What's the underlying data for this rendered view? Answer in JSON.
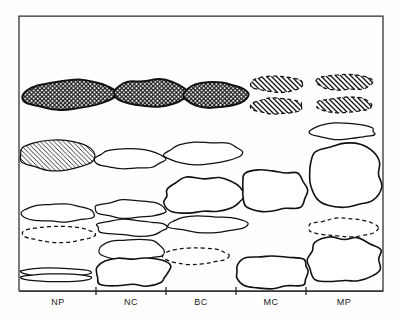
{
  "figure": {
    "name": "clast-shape-distribution-diagram",
    "background_color": "#fefefe",
    "frame_color": "#2b2b2b",
    "ink_color": "#111111"
  },
  "axis": {
    "name": "x-axis",
    "categories": [
      "NP",
      "NC",
      "BC",
      "MC",
      "MP"
    ],
    "tick_positions_px": [
      96,
      166,
      236,
      306
    ],
    "axis_y_px": 291,
    "axis_x_start_px": 19,
    "axis_x_end_px": 383,
    "label_y_px": 305
  },
  "frame": {
    "left_px": 19,
    "top_px": 16,
    "right_px": 383,
    "bottom_px": 291
  },
  "legend_patterns": {
    "crosshatch": "cross-hatched fill, solid outline",
    "diagonal_hatch_solid": "diagonal hatched fill, solid outline",
    "diagonal_hatch_dashed": "diagonal hatched fill, dashed outline",
    "plain_solid": "unfilled, solid outline",
    "plain_dashed": "unfilled, dashed outline"
  },
  "chart_data": {
    "type": "diagram",
    "title": "",
    "xlabel": "",
    "ylabel": "",
    "categories": [
      "NP",
      "NC",
      "BC",
      "MC",
      "MP"
    ],
    "column_centers_px": [
      58,
      131,
      201,
      271,
      344
    ],
    "shapes": [
      {
        "id": "s01",
        "column": "NP",
        "row": 1,
        "fill": "crosshatch",
        "outline": "solid",
        "cx": 68,
        "cy": 95,
        "rx": 47,
        "ry": 14,
        "rot": -3,
        "rough": 1.0
      },
      {
        "id": "s02",
        "column": "NC",
        "row": 1,
        "fill": "crosshatch",
        "outline": "solid",
        "cx": 151,
        "cy": 93,
        "rx": 36,
        "ry": 13,
        "rot": 0,
        "rough": 0.9
      },
      {
        "id": "s03",
        "column": "BC",
        "row": 1,
        "fill": "crosshatch",
        "outline": "solid",
        "cx": 215,
        "cy": 95,
        "rx": 32,
        "ry": 13,
        "rot": 0,
        "rough": 0.9
      },
      {
        "id": "s04",
        "column": "MC",
        "row": 1,
        "fill": "diagonal",
        "outline": "dashed",
        "cx": 277,
        "cy": 84,
        "rx": 26,
        "ry": 8,
        "rot": 0,
        "rough": 0.8
      },
      {
        "id": "s05",
        "column": "MC",
        "row": 1,
        "fill": "diagonal",
        "outline": "dashed",
        "cx": 277,
        "cy": 106,
        "rx": 26,
        "ry": 8,
        "rot": 0,
        "rough": 0.8
      },
      {
        "id": "s06",
        "column": "MP",
        "row": 1,
        "fill": "diagonal",
        "outline": "dashed",
        "cx": 344,
        "cy": 82,
        "rx": 28,
        "ry": 8,
        "rot": 0,
        "rough": 0.8
      },
      {
        "id": "s07",
        "column": "MP",
        "row": 1,
        "fill": "diagonal",
        "outline": "dashed",
        "cx": 344,
        "cy": 105,
        "rx": 28,
        "ry": 8,
        "rot": 0,
        "rough": 0.8
      },
      {
        "id": "s08",
        "column": "MP",
        "row": 2,
        "fill": "none",
        "outline": "solid",
        "cx": 342,
        "cy": 131,
        "rx": 33,
        "ry": 8,
        "rot": 0,
        "rough": 1.1
      },
      {
        "id": "s09",
        "column": "NP",
        "row": 2,
        "fill": "diagonal",
        "outline": "solid",
        "cx": 58,
        "cy": 155,
        "rx": 38,
        "ry": 15,
        "rot": 0,
        "rough": 0.8
      },
      {
        "id": "s10",
        "column": "NC",
        "row": 2,
        "fill": "none",
        "outline": "solid",
        "cx": 130,
        "cy": 159,
        "rx": 33,
        "ry": 10,
        "rot": 0,
        "rough": 1.2
      },
      {
        "id": "s11",
        "column": "BC",
        "row": 2,
        "fill": "none",
        "outline": "solid",
        "cx": 204,
        "cy": 153,
        "rx": 38,
        "ry": 11,
        "rot": -2,
        "rough": 1.0
      },
      {
        "id": "s12",
        "column": "MP",
        "row": 2,
        "fill": "none",
        "outline": "solid",
        "cx": 344,
        "cy": 175,
        "rx": 36,
        "ry": 30,
        "rot": 0,
        "rough": 1.3,
        "boxy": true
      },
      {
        "id": "s13",
        "column": "BC",
        "row": 3,
        "fill": "none",
        "outline": "solid",
        "cx": 204,
        "cy": 195,
        "rx": 38,
        "ry": 17,
        "rot": 0,
        "rough": 1.6,
        "boxy": true
      },
      {
        "id": "s14",
        "column": "MC",
        "row": 3,
        "fill": "none",
        "outline": "solid",
        "cx": 273,
        "cy": 190,
        "rx": 32,
        "ry": 20,
        "rot": 0,
        "rough": 1.4,
        "boxy": true
      },
      {
        "id": "s15",
        "column": "NP",
        "row": 3,
        "fill": "none",
        "outline": "solid",
        "cx": 58,
        "cy": 213,
        "rx": 36,
        "ry": 9,
        "rot": 0,
        "rough": 1.1
      },
      {
        "id": "s16",
        "column": "NC",
        "row": 3,
        "fill": "none",
        "outline": "solid",
        "cx": 131,
        "cy": 209,
        "rx": 36,
        "ry": 9,
        "rot": 0,
        "rough": 1.1
      },
      {
        "id": "s17",
        "column": "NC",
        "row": 4,
        "fill": "none",
        "outline": "solid",
        "cx": 131,
        "cy": 228,
        "rx": 36,
        "ry": 8,
        "rot": 0,
        "rough": 1.1
      },
      {
        "id": "s18",
        "column": "BC",
        "row": 4,
        "fill": "none",
        "outline": "solid",
        "cx": 207,
        "cy": 224,
        "rx": 40,
        "ry": 8,
        "rot": 0,
        "rough": 1.0
      },
      {
        "id": "s19",
        "column": "NP",
        "row": 4,
        "fill": "none",
        "outline": "dashed",
        "cx": 58,
        "cy": 234,
        "rx": 36,
        "ry": 8,
        "rot": 0,
        "rough": 0.9
      },
      {
        "id": "s20",
        "column": "MP",
        "row": 4,
        "fill": "none",
        "outline": "dashed",
        "cx": 344,
        "cy": 228,
        "rx": 35,
        "ry": 9,
        "rot": 0,
        "rough": 1.0
      },
      {
        "id": "s21",
        "column": "NC",
        "row": 5,
        "fill": "none",
        "outline": "solid",
        "cx": 132,
        "cy": 250,
        "rx": 34,
        "ry": 11,
        "rot": 0,
        "rough": 1.2
      },
      {
        "id": "s22",
        "column": "BC",
        "row": 5,
        "fill": "none",
        "outline": "dashed",
        "cx": 196,
        "cy": 256,
        "rx": 33,
        "ry": 8,
        "rot": 0,
        "rough": 0.9
      },
      {
        "id": "s23",
        "column": "MP",
        "row": 5,
        "fill": "none",
        "outline": "solid",
        "cx": 344,
        "cy": 259,
        "rx": 35,
        "ry": 22,
        "rot": 0,
        "rough": 1.7,
        "boxy": true
      },
      {
        "id": "s24",
        "column": "NP",
        "row": 6,
        "fill": "none",
        "outline": "solid",
        "cx": 56,
        "cy": 272,
        "rx": 36,
        "ry": 4,
        "rot": 0,
        "rough": 0.6
      },
      {
        "id": "s25",
        "column": "NP",
        "row": 6,
        "fill": "none",
        "outline": "solid",
        "cx": 56,
        "cy": 278,
        "rx": 36,
        "ry": 4,
        "rot": 0,
        "rough": 0.6
      },
      {
        "id": "s26",
        "column": "NC",
        "row": 6,
        "fill": "none",
        "outline": "solid",
        "cx": 132,
        "cy": 272,
        "rx": 36,
        "ry": 14,
        "rot": 0,
        "rough": 1.3,
        "boxy": true
      },
      {
        "id": "s27",
        "column": "MC",
        "row": 6,
        "fill": "none",
        "outline": "solid",
        "cx": 273,
        "cy": 272,
        "rx": 34,
        "ry": 16,
        "rot": 0,
        "rough": 1.4,
        "boxy": true
      }
    ]
  }
}
